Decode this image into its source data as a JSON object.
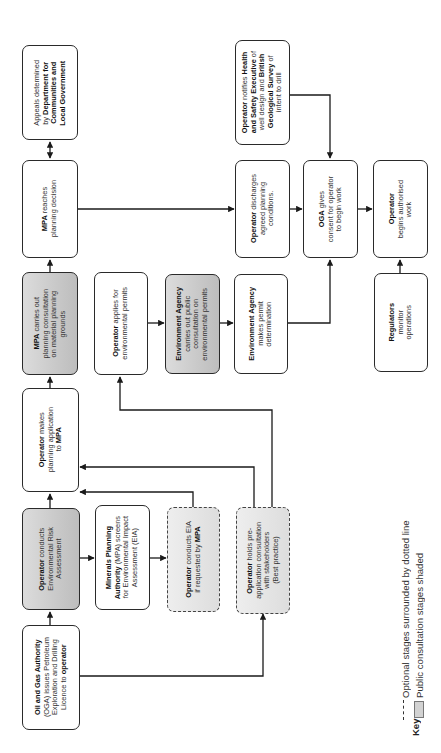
{
  "diagram": {
    "orientation": "rotated-90-ccw",
    "colors": {
      "line": "#1a1a1a",
      "shaded_fill": "#c9c9c9",
      "optional_fill": "#e4e4e4",
      "box_fill": "#ffffff"
    },
    "nodes": [
      {
        "id": "appeals",
        "style": "normal",
        "parts": [
          [
            "Appeals determined\nby ",
            false
          ],
          [
            "Department for\nCommunities and\nLocal Government",
            true
          ]
        ]
      },
      {
        "id": "mpa_decision",
        "style": "normal",
        "parts": [
          [
            "MPA",
            true
          ],
          [
            " reaches\nplanning decision",
            false
          ]
        ]
      },
      {
        "id": "mpa_consultation",
        "style": "shaded",
        "parts": [
          [
            "MPA",
            true
          ],
          [
            " carries out\nplanning consultation\non material planning\ngrounds",
            false
          ]
        ]
      },
      {
        "id": "planning_application",
        "style": "normal",
        "parts": [
          [
            "Operator",
            true
          ],
          [
            " makes\nplanning application\nto ",
            false
          ],
          [
            "MPA",
            true
          ]
        ]
      },
      {
        "id": "env_risk_assessment",
        "style": "shaded",
        "parts": [
          [
            "Operator",
            true
          ],
          [
            " conducts\nEnvironmental Risk\nAssessment",
            false
          ]
        ]
      },
      {
        "id": "oga_licence",
        "style": "normal",
        "parts": [
          [
            "Oil and Gas Authority",
            true
          ],
          [
            "\n(OGA) issues Petroleum\nExploration and Drilling\nLicence to ",
            false
          ],
          [
            "operator",
            true
          ]
        ]
      },
      {
        "id": "env_permits_apply",
        "style": "normal",
        "parts": [
          [
            "Operator",
            true
          ],
          [
            " applies for\nenvironmental permits",
            false
          ]
        ]
      },
      {
        "id": "mpa_screens",
        "style": "normal",
        "parts": [
          [
            "Minerals Planning\nAuthority",
            true
          ],
          [
            " (MPA) screens\nfor Environmental Impact\nAssessment (EIA)",
            false
          ]
        ]
      },
      {
        "id": "ea_consultation",
        "style": "shaded",
        "parts": [
          [
            "Environment Agency",
            true
          ],
          [
            "\ncarries out public\nconsultation on\nenvironmental permits",
            false
          ]
        ]
      },
      {
        "id": "conducts_eia",
        "style": "optional",
        "parts": [
          [
            "Operator",
            true
          ],
          [
            " conducts EIA\nif requested by ",
            false
          ],
          [
            "MPA",
            true
          ]
        ]
      },
      {
        "id": "notify_hse",
        "style": "normal",
        "parts": [
          [
            "Operator",
            true
          ],
          [
            " notifies ",
            false
          ],
          [
            "Health\nand Safety Executive",
            true
          ],
          [
            " of\nwell design and ",
            false
          ],
          [
            "British\nGeological Survey",
            true
          ],
          [
            " of\nintent to drill",
            false
          ]
        ]
      },
      {
        "id": "discharge_conditions",
        "style": "normal",
        "parts": [
          [
            "Operator",
            true
          ],
          [
            " discharges\nagreed planning\nconditions.",
            false
          ]
        ]
      },
      {
        "id": "ea_determination",
        "style": "normal",
        "parts": [
          [
            "Environment Agency",
            true
          ],
          [
            "\nmakes permit\ndetermination",
            false
          ]
        ]
      },
      {
        "id": "pre_app_consultation",
        "style": "optional",
        "parts": [
          [
            "Operator",
            true
          ],
          [
            " holds pre-\napplication consultation\nwith stakeholders\n(Best practice)",
            false
          ]
        ]
      },
      {
        "id": "oga_consent",
        "style": "normal",
        "parts": [
          [
            "OGA",
            true
          ],
          [
            " gives\nconsent for operator\nto begin work",
            false
          ]
        ]
      },
      {
        "id": "begin_work",
        "style": "normal",
        "parts": [
          [
            "Operator",
            true
          ],
          [
            "\nbegins authorised\nwork",
            false
          ]
        ]
      },
      {
        "id": "regulators",
        "style": "normal",
        "parts": [
          [
            "Regulators",
            true
          ],
          [
            "\nmonitor\noperations",
            false
          ]
        ]
      }
    ],
    "key": {
      "title": "Key",
      "items": [
        {
          "symbol": "dashed-line",
          "label": "Optional stages surrounded by dotted line"
        },
        {
          "symbol": "shaded-box",
          "label": "Public consultation stages shaded"
        }
      ]
    }
  }
}
